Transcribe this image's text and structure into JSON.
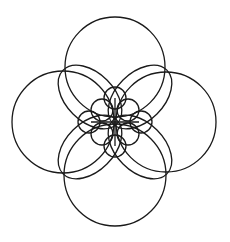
{
  "diagram": {
    "title": "",
    "stroke_color": "#1a1a1a",
    "background": "#ffffff",
    "center": [
      115,
      122
    ],
    "large_circles": [
      {
        "name": "top",
        "cx": 115,
        "cy": 67,
        "r": 50
      },
      {
        "name": "left",
        "cx": 63,
        "cy": 122,
        "r": 51
      },
      {
        "name": "right",
        "cx": 166,
        "cy": 122,
        "r": 50
      },
      {
        "name": "bottom",
        "cx": 115,
        "cy": 175,
        "r": 51
      }
    ],
    "petal_ellipses": [
      {
        "name": "upper-left",
        "cx": 90,
        "cy": 97,
        "rx": 38,
        "ry": 24,
        "rotate": 45
      },
      {
        "name": "upper-right",
        "cx": 140,
        "cy": 97,
        "rx": 38,
        "ry": 24,
        "rotate": -45
      },
      {
        "name": "lower-left",
        "cx": 90,
        "cy": 147,
        "rx": 38,
        "ry": 24,
        "rotate": -45
      },
      {
        "name": "lower-right",
        "cx": 140,
        "cy": 147,
        "rx": 38,
        "ry": 24,
        "rotate": 45
      }
    ],
    "diagonal_small_circles": [
      {
        "name": "upper-left",
        "cx": 102,
        "cy": 110,
        "r": 11
      },
      {
        "name": "upper-right",
        "cx": 128,
        "cy": 110,
        "r": 11
      },
      {
        "name": "lower-left",
        "cx": 102,
        "cy": 134,
        "r": 11
      },
      {
        "name": "lower-right",
        "cx": 128,
        "cy": 134,
        "r": 11
      }
    ],
    "axis_small_circles": [
      {
        "name": "top",
        "cx": 115,
        "cy": 98,
        "r": 11
      },
      {
        "name": "bottom",
        "cx": 115,
        "cy": 146,
        "r": 11
      },
      {
        "name": "left",
        "cx": 89,
        "cy": 122,
        "r": 11
      },
      {
        "name": "right",
        "cx": 141,
        "cy": 122,
        "r": 11
      }
    ]
  }
}
